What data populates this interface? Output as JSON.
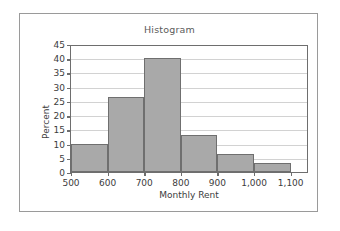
{
  "panel": {
    "background_color": "#ffffff",
    "border_color": "#9a9a9a"
  },
  "chart_data": {
    "type": "bar",
    "title": "Histogram",
    "xlabel": "Monthly Rent",
    "ylabel": "Percent",
    "bin_edges": [
      500,
      600,
      700,
      800,
      900,
      1000,
      1100
    ],
    "categories": [
      "500-600",
      "600-700",
      "700-800",
      "800-900",
      "900-1,000",
      "1,000-1,100"
    ],
    "values": [
      10,
      26.5,
      40,
      13,
      6.5,
      3.2
    ],
    "xtick_labels": [
      "500",
      "600",
      "700",
      "800",
      "900",
      "1,000",
      "1,100"
    ],
    "xtick_values": [
      500,
      600,
      700,
      800,
      900,
      1000,
      1100
    ],
    "ytick_labels": [
      "0",
      "5",
      "10",
      "15",
      "20",
      "25",
      "30",
      "35",
      "40",
      "45"
    ],
    "ytick_values": [
      0,
      5,
      10,
      15,
      20,
      25,
      30,
      35,
      40,
      45
    ],
    "ylim": [
      0,
      45
    ],
    "xlim": [
      500,
      1150
    ],
    "grid": true,
    "legend": false,
    "bar_fill_color": "#a9a9a9",
    "bar_edge_color": "#6f6f6f",
    "gridline_color": "#d2d2d2",
    "axis_color": "#6e6e6e"
  }
}
